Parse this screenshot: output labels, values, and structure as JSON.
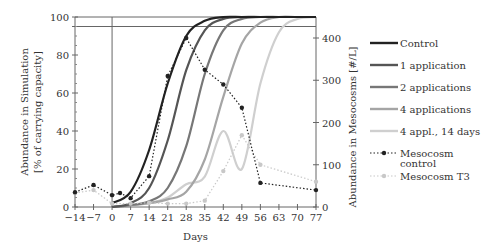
{
  "chart_data": {
    "type": "line",
    "title": "",
    "xlabel": "Days",
    "ylabel_left": "Abundance in Simulation [% of carrying capacity]",
    "ylabel_left_lines": [
      "Abundance in Simulation",
      "[% of carrying capacity]"
    ],
    "ylabel_right": "Abundance in Mesocosms [#/L]",
    "xlim": [
      -14,
      77
    ],
    "ylim_left": [
      0,
      100
    ],
    "ylim_right": [
      0,
      450
    ],
    "x_ticks": [
      -14,
      -7,
      0,
      7,
      14,
      21,
      28,
      35,
      42,
      49,
      56,
      63,
      70,
      77
    ],
    "y_ticks_left": [
      0,
      20,
      40,
      60,
      80,
      100
    ],
    "y_ticks_right": [
      0,
      100,
      200,
      300,
      400
    ],
    "reference_lines": {
      "horizontal_left_value": 95,
      "vertical_x_value": 0
    },
    "grid": false,
    "legend_position": "right",
    "series": [
      {
        "name": "Control",
        "axis": "left",
        "style": "solid",
        "color": "#222222",
        "width": 2.2,
        "x": [
          0,
          7,
          14,
          21,
          28,
          35,
          42,
          49,
          56,
          63,
          70,
          77
        ],
        "values": [
          2,
          8,
          30,
          65,
          90,
          98,
          100,
          100,
          100,
          100,
          100,
          100
        ]
      },
      {
        "name": "1 application",
        "axis": "left",
        "style": "solid",
        "color": "#555555",
        "width": 2.2,
        "x": [
          0,
          7,
          14,
          21,
          28,
          35,
          42,
          49,
          56,
          63,
          70,
          77
        ],
        "values": [
          0,
          2,
          10,
          35,
          72,
          93,
          99,
          100,
          100,
          100,
          100,
          100
        ]
      },
      {
        "name": "2 applications",
        "axis": "left",
        "style": "solid",
        "color": "#777777",
        "width": 2.2,
        "x": [
          0,
          7,
          14,
          21,
          28,
          35,
          42,
          49,
          56,
          63,
          70,
          77
        ],
        "values": [
          0,
          1,
          3,
          10,
          32,
          70,
          93,
          99,
          100,
          100,
          100,
          100
        ]
      },
      {
        "name": "4 applications",
        "axis": "left",
        "style": "solid",
        "color": "#a5a5a5",
        "width": 2.2,
        "x": [
          0,
          7,
          14,
          21,
          28,
          35,
          42,
          49,
          56,
          63,
          70,
          77
        ],
        "values": [
          0,
          1,
          2,
          4,
          8,
          25,
          58,
          86,
          97,
          100,
          100,
          100
        ]
      },
      {
        "name": "4 appl., 14 days",
        "axis": "left",
        "style": "solid",
        "color": "#cfcfcf",
        "width": 2.2,
        "x": [
          0,
          7,
          14,
          21,
          28,
          35,
          42,
          49,
          56,
          63,
          70,
          77
        ],
        "values": [
          0,
          1,
          2,
          5,
          12,
          16,
          40,
          20,
          65,
          92,
          99,
          100
        ]
      },
      {
        "name": "Mesocosm control",
        "axis": "right",
        "style": "dotted",
        "color": "#222222",
        "marker": "circle",
        "x": [
          -14,
          -7,
          0,
          3,
          7,
          14,
          21,
          28,
          35,
          42,
          49,
          56,
          77
        ],
        "values": [
          35,
          52,
          28,
          33,
          21,
          73,
          310,
          400,
          325,
          290,
          235,
          57,
          40
        ]
      },
      {
        "name": "Mesocosm T3",
        "axis": "right",
        "style": "dotted",
        "color": "#c8c8c8",
        "marker": "circle",
        "x": [
          -14,
          -7,
          0,
          7,
          14,
          21,
          28,
          35,
          42,
          49,
          56,
          77
        ],
        "values": [
          33,
          40,
          8,
          8,
          10,
          8,
          8,
          15,
          85,
          170,
          100,
          60
        ]
      }
    ]
  },
  "legend": {
    "items": [
      {
        "label": "Control",
        "color": "#222222",
        "style": "solid"
      },
      {
        "label": "1 application",
        "color": "#555555",
        "style": "solid"
      },
      {
        "label": "2 applications",
        "color": "#777777",
        "style": "solid"
      },
      {
        "label": "4 applications",
        "color": "#a5a5a5",
        "style": "solid"
      },
      {
        "label": "4 appl., 14 days",
        "color": "#cfcfcf",
        "style": "solid"
      },
      {
        "label": "Mesocosm",
        "label2": "control",
        "color": "#222222",
        "style": "dotted"
      },
      {
        "label": "Mesocosm T3",
        "color": "#c8c8c8",
        "style": "dotted"
      }
    ]
  }
}
